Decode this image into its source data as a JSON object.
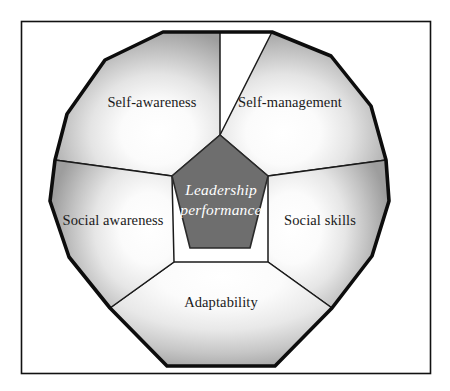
{
  "figure": {
    "frame": {
      "border_color": "#000000",
      "background_color": "#ffffff"
    }
  },
  "core": {
    "name": "leadership-performance-core",
    "line1": "Leadership",
    "line2": "performance",
    "fill_color": "#6e6e6e",
    "text_color": "#ffffff",
    "shape": "pentagon"
  },
  "segments": [
    {
      "id": "self-awareness",
      "label": "Self-awareness",
      "position": "top-left",
      "label_x": 152,
      "label_y": 104
    },
    {
      "id": "self-management",
      "label": "Self-management",
      "position": "top-right",
      "label_x": 290,
      "label_y": 104
    },
    {
      "id": "social-skills",
      "label": "Social skills",
      "position": "right",
      "label_x": 320,
      "label_y": 222
    },
    {
      "id": "adaptability",
      "label": "Adaptability",
      "position": "bottom",
      "label_x": 221,
      "label_y": 304
    },
    {
      "id": "social-awareness",
      "label": "Social awareness",
      "position": "left",
      "label_x": 113,
      "label_y": 222
    }
  ],
  "style": {
    "outer_shape": "dodecagon",
    "outer_stroke_color": "#000000",
    "segment_gradient_inner": "#ffffff",
    "segment_gradient_outer": "#9a9a9a",
    "divider_stroke_color": "#1a1a1a"
  }
}
